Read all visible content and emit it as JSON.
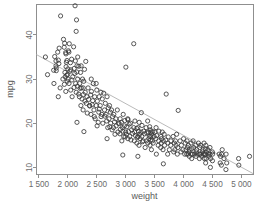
{
  "chart_data": {
    "type": "scatter",
    "title": "",
    "xlabel": "weight",
    "ylabel": "mpg",
    "xlim": [
      1450,
      5200
    ],
    "ylim": [
      8.5,
      47
    ],
    "grid": false,
    "legend": null,
    "marker": "open-circle",
    "marker_color": "#3a3a3a",
    "trendline": {
      "visible": true,
      "color": "#a8a8a8",
      "x": [
        1450,
        5200
      ],
      "y": [
        35.6,
        8.6
      ]
    },
    "xticks": [
      1500,
      2000,
      2500,
      3000,
      3500,
      4000,
      4500,
      5000
    ],
    "xticklabels": [
      "1 500",
      "2 000",
      "2 500",
      "3 000",
      "3 500",
      "4 000",
      "4 500",
      "5 000"
    ],
    "yticks": [
      10,
      20,
      30,
      40
    ],
    "yticklabels": [
      "10",
      "20",
      "30",
      "40"
    ],
    "points": [
      [
        1613,
        35.0
      ],
      [
        1649,
        31.0
      ],
      [
        1755,
        32.0
      ],
      [
        1760,
        29.0
      ],
      [
        1773,
        35.1
      ],
      [
        1795,
        33.0
      ],
      [
        1795,
        34.1
      ],
      [
        1800,
        31.9
      ],
      [
        1825,
        36.1
      ],
      [
        1835,
        26.0
      ],
      [
        1836,
        34.3
      ],
      [
        1845,
        33.5
      ],
      [
        1850,
        37.0
      ],
      [
        1867,
        28.0
      ],
      [
        1875,
        44.3
      ],
      [
        1915,
        30.0
      ],
      [
        1925,
        39.0
      ],
      [
        1937,
        37.2
      ],
      [
        1940,
        28.8
      ],
      [
        1945,
        38.1
      ],
      [
        1950,
        31.5
      ],
      [
        1955,
        30.5
      ],
      [
        1963,
        36.0
      ],
      [
        1965,
        27.2
      ],
      [
        1968,
        35.7
      ],
      [
        1970,
        32.8
      ],
      [
        1975,
        33.8
      ],
      [
        1980,
        30.9
      ],
      [
        1985,
        34.2
      ],
      [
        1990,
        29.5
      ],
      [
        1995,
        31.0
      ],
      [
        2000,
        32.3
      ],
      [
        2003,
        30.0
      ],
      [
        2010,
        36.4
      ],
      [
        2019,
        36.1
      ],
      [
        2020,
        29.0
      ],
      [
        2025,
        38.0
      ],
      [
        2035,
        31.8
      ],
      [
        2045,
        33.7
      ],
      [
        2050,
        27.5
      ],
      [
        2051,
        32.1
      ],
      [
        2065,
        34.5
      ],
      [
        2070,
        29.8
      ],
      [
        2074,
        26.0
      ],
      [
        2085,
        30.5
      ],
      [
        2100,
        37.3
      ],
      [
        2108,
        28.1
      ],
      [
        2110,
        32.4
      ],
      [
        2120,
        31.3
      ],
      [
        2125,
        46.6
      ],
      [
        2130,
        34.1
      ],
      [
        2135,
        29.0
      ],
      [
        2144,
        40.8
      ],
      [
        2145,
        27.0
      ],
      [
        2150,
        43.4
      ],
      [
        2155,
        31.6
      ],
      [
        2158,
        33.0
      ],
      [
        2164,
        28.4
      ],
      [
        2170,
        30.0
      ],
      [
        2171,
        35.0
      ],
      [
        2188,
        26.6
      ],
      [
        2190,
        32.9
      ],
      [
        2200,
        26.0
      ],
      [
        2205,
        29.0
      ],
      [
        2212,
        27.9
      ],
      [
        2220,
        31.5
      ],
      [
        2226,
        24.0
      ],
      [
        2230,
        33.0
      ],
      [
        2234,
        28.0
      ],
      [
        2245,
        25.5
      ],
      [
        2254,
        30.0
      ],
      [
        2264,
        23.0
      ],
      [
        2265,
        28.0
      ],
      [
        2270,
        26.5
      ],
      [
        2275,
        29.5
      ],
      [
        2278,
        18.1
      ],
      [
        2288,
        32.2
      ],
      [
        2295,
        25.0
      ],
      [
        2300,
        27.0
      ],
      [
        2310,
        34.0
      ],
      [
        2320,
        24.5
      ],
      [
        2330,
        26.0
      ],
      [
        2335,
        22.3
      ],
      [
        2350,
        28.0
      ],
      [
        2360,
        25.4
      ],
      [
        2375,
        24.0
      ],
      [
        2379,
        23.9
      ],
      [
        2395,
        26.4
      ],
      [
        2400,
        22.0
      ],
      [
        2405,
        30.0
      ],
      [
        2408,
        27.2
      ],
      [
        2420,
        24.2
      ],
      [
        2430,
        25.1
      ],
      [
        2440,
        29.0
      ],
      [
        2451,
        23.0
      ],
      [
        2464,
        26.0
      ],
      [
        2472,
        21.0
      ],
      [
        2490,
        24.0
      ],
      [
        2500,
        27.5
      ],
      [
        2506,
        19.4
      ],
      [
        2510,
        25.0
      ],
      [
        2525,
        20.2
      ],
      [
        2535,
        22.5
      ],
      [
        2542,
        26.0
      ],
      [
        2545,
        23.2
      ],
      [
        2560,
        24.0
      ],
      [
        2572,
        27.0
      ],
      [
        2575,
        21.5
      ],
      [
        2587,
        22.0
      ],
      [
        2595,
        25.5
      ],
      [
        2605,
        20.0
      ],
      [
        2620,
        26.8
      ],
      [
        2634,
        23.0
      ],
      [
        2640,
        21.6
      ],
      [
        2648,
        24.5
      ],
      [
        2660,
        22.0
      ],
      [
        2672,
        20.5
      ],
      [
        2678,
        26.0
      ],
      [
        2690,
        19.0
      ],
      [
        2700,
        23.5
      ],
      [
        2711,
        21.0
      ],
      [
        2720,
        24.0
      ],
      [
        2725,
        19.2
      ],
      [
        2735,
        22.5
      ],
      [
        2740,
        20.0
      ],
      [
        2755,
        23.0
      ],
      [
        2765,
        18.5
      ],
      [
        2774,
        21.5
      ],
      [
        2789,
        19.0
      ],
      [
        2795,
        22.0
      ],
      [
        2807,
        20.3
      ],
      [
        2815,
        17.5
      ],
      [
        2830,
        21.0
      ],
      [
        2835,
        19.4
      ],
      [
        2855,
        23.0
      ],
      [
        2865,
        18.0
      ],
      [
        2875,
        20.0
      ],
      [
        2890,
        19.9
      ],
      [
        2900,
        17.6
      ],
      [
        2904,
        21.0
      ],
      [
        2910,
        18.6
      ],
      [
        2925,
        20.2
      ],
      [
        2933,
        16.0
      ],
      [
        2945,
        19.0
      ],
      [
        2950,
        18.2
      ],
      [
        2957,
        22.0
      ],
      [
        2965,
        17.0
      ],
      [
        2979,
        19.4
      ],
      [
        2984,
        20.6
      ],
      [
        2990,
        16.9
      ],
      [
        3000,
        18.0
      ],
      [
        3003,
        32.7
      ],
      [
        3012,
        17.5
      ],
      [
        3021,
        19.2
      ],
      [
        3035,
        21.0
      ],
      [
        3039,
        16.5
      ],
      [
        3048,
        18.1
      ],
      [
        3060,
        19.8
      ],
      [
        3070,
        17.0
      ],
      [
        3085,
        20.0
      ],
      [
        3090,
        16.2
      ],
      [
        3102,
        18.5
      ],
      [
        3121,
        17.7
      ],
      [
        3139,
        38.0
      ],
      [
        3139,
        19.0
      ],
      [
        3150,
        16.0
      ],
      [
        3155,
        18.0
      ],
      [
        3160,
        20.5
      ],
      [
        3169,
        17.2
      ],
      [
        3190,
        18.8
      ],
      [
        3193,
        15.5
      ],
      [
        3205,
        16.8
      ],
      [
        3210,
        19.0
      ],
      [
        3211,
        17.0
      ],
      [
        3221,
        18.2
      ],
      [
        3230,
        15.0
      ],
      [
        3233,
        20.2
      ],
      [
        3240,
        17.5
      ],
      [
        3250,
        16.5
      ],
      [
        3265,
        18.0
      ],
      [
        3270,
        22.4
      ],
      [
        3278,
        17.0
      ],
      [
        3282,
        19.5
      ],
      [
        3288,
        15.8
      ],
      [
        3302,
        16.0
      ],
      [
        3310,
        18.2
      ],
      [
        3329,
        17.6
      ],
      [
        3336,
        14.5
      ],
      [
        3353,
        19.0
      ],
      [
        3360,
        16.0
      ],
      [
        3365,
        17.8
      ],
      [
        3381,
        15.5
      ],
      [
        3390,
        18.0
      ],
      [
        3399,
        16.5
      ],
      [
        3410,
        17.0
      ],
      [
        3415,
        19.2
      ],
      [
        3420,
        15.0
      ],
      [
        3425,
        18.5
      ],
      [
        3432,
        17.0
      ],
      [
        3433,
        16.2
      ],
      [
        3439,
        18.0
      ],
      [
        3445,
        14.0
      ],
      [
        3449,
        17.5
      ],
      [
        3459,
        16.0
      ],
      [
        3465,
        18.1
      ],
      [
        3475,
        15.5
      ],
      [
        3490,
        17.0
      ],
      [
        3504,
        18.0
      ],
      [
        3520,
        16.5
      ],
      [
        3525,
        19.0
      ],
      [
        3530,
        13.0
      ],
      [
        3535,
        17.2
      ],
      [
        3563,
        15.0
      ],
      [
        3570,
        16.0
      ],
      [
        3574,
        18.2
      ],
      [
        3605,
        14.5
      ],
      [
        3609,
        17.0
      ],
      [
        3613,
        15.5
      ],
      [
        3620,
        16.5
      ],
      [
        3632,
        18.0
      ],
      [
        3645,
        14.0
      ],
      [
        3651,
        16.0
      ],
      [
        3664,
        17.5
      ],
      [
        3672,
        15.0
      ],
      [
        3693,
        16.2
      ],
      [
        3700,
        26.6
      ],
      [
        3725,
        13.0
      ],
      [
        3730,
        15.5
      ],
      [
        3735,
        16.9
      ],
      [
        3755,
        14.0
      ],
      [
        3777,
        15.0
      ],
      [
        3781,
        16.0
      ],
      [
        3820,
        17.0
      ],
      [
        3830,
        13.5
      ],
      [
        3840,
        15.5
      ],
      [
        3850,
        14.0
      ],
      [
        3860,
        16.0
      ],
      [
        3870,
        15.0
      ],
      [
        3880,
        17.5
      ],
      [
        3892,
        13.0
      ],
      [
        3900,
        14.5
      ],
      [
        3907,
        22.9
      ],
      [
        3940,
        16.0
      ],
      [
        3955,
        13.5
      ],
      [
        3962,
        15.0
      ],
      [
        3988,
        14.0
      ],
      [
        4000,
        16.5
      ],
      [
        4020,
        13.0
      ],
      [
        4029,
        15.5
      ],
      [
        4042,
        14.0
      ],
      [
        4054,
        13.0
      ],
      [
        4060,
        16.0
      ],
      [
        4066,
        14.5
      ],
      [
        4077,
        13.0
      ],
      [
        4082,
        15.0
      ],
      [
        4096,
        13.5
      ],
      [
        4098,
        14.0
      ],
      [
        4100,
        12.5
      ],
      [
        4129,
        15.5
      ],
      [
        4135,
        13.0
      ],
      [
        4140,
        14.2
      ],
      [
        4141,
        12.0
      ],
      [
        4154,
        13.0
      ],
      [
        4165,
        16.0
      ],
      [
        4175,
        14.5
      ],
      [
        4190,
        13.0
      ],
      [
        4209,
        15.0
      ],
      [
        4215,
        12.5
      ],
      [
        4220,
        13.5
      ],
      [
        4227,
        14.0
      ],
      [
        4237,
        13.0
      ],
      [
        4257,
        15.5
      ],
      [
        4274,
        12.0
      ],
      [
        4278,
        13.0
      ],
      [
        4280,
        14.5
      ],
      [
        4294,
        13.0
      ],
      [
        4295,
        15.0
      ],
      [
        4312,
        12.5
      ],
      [
        4325,
        13.5
      ],
      [
        4335,
        14.0
      ],
      [
        4341,
        13.0
      ],
      [
        4354,
        15.5
      ],
      [
        4360,
        12.0
      ],
      [
        4363,
        13.0
      ],
      [
        4376,
        14.2
      ],
      [
        4380,
        13.0
      ],
      [
        4382,
        11.0
      ],
      [
        4385,
        15.0
      ],
      [
        4390,
        12.0
      ],
      [
        4395,
        13.5
      ],
      [
        4422,
        14.0
      ],
      [
        4425,
        13.0
      ],
      [
        4440,
        12.5
      ],
      [
        4456,
        14.5
      ],
      [
        4457,
        13.0
      ],
      [
        4464,
        10.0
      ],
      [
        4467,
        12.0
      ],
      [
        4498,
        13.5
      ],
      [
        4499,
        11.5
      ],
      [
        4502,
        13.0
      ],
      [
        4615,
        13.0
      ],
      [
        4633,
        11.0
      ],
      [
        4638,
        12.5
      ],
      [
        4654,
        10.5
      ],
      [
        4657,
        13.0
      ],
      [
        4668,
        14.0
      ],
      [
        4699,
        12.0
      ],
      [
        4732,
        9.5
      ],
      [
        4735,
        13.0
      ],
      [
        4746,
        11.0
      ],
      [
        4951,
        12.0
      ],
      [
        4955,
        10.5
      ],
      [
        5140,
        12.5
      ],
      [
        3651,
        10.8
      ],
      [
        2950,
        12.8
      ],
      [
        3211,
        12.5
      ],
      [
        2490,
        29.0
      ],
      [
        1800,
        32.5
      ],
      [
        2158,
        20.2
      ],
      [
        2457,
        21.5
      ],
      [
        2678,
        16.5
      ],
      [
        3039,
        20.8
      ],
      [
        3380,
        20.5
      ]
    ]
  }
}
